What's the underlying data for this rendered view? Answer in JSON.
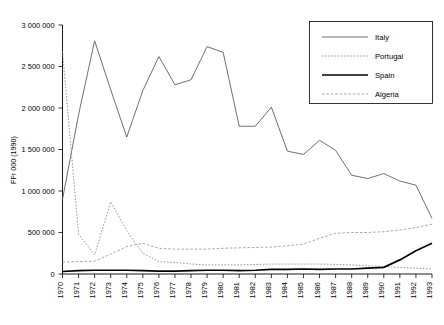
{
  "chart_data": {
    "type": "line",
    "title": "",
    "xlabel": "",
    "ylabel": "FFr 000 (1990)",
    "x": [
      1970,
      1971,
      1972,
      1973,
      1974,
      1975,
      1976,
      1977,
      1978,
      1979,
      1980,
      1981,
      1982,
      1983,
      1984,
      1985,
      1986,
      1987,
      1988,
      1989,
      1990,
      1991,
      1992,
      1993
    ],
    "xtick_labels": [
      "1970",
      "1971",
      "1972",
      "1973",
      "1974",
      "1975",
      "1976",
      "1977",
      "1978",
      "1979",
      "1980",
      "1981",
      "1982",
      "1983",
      "1984",
      "1985",
      "1986",
      "1987",
      "1988",
      "1989",
      "1990",
      "1991",
      "1992",
      "1993"
    ],
    "ytick_labels": [
      "0",
      "500 000",
      "1 000 000",
      "1 500 000",
      "2 000 000",
      "2 500 000",
      "3 000 000"
    ],
    "ytick_values": [
      0,
      500000,
      1000000,
      1500000,
      2000000,
      2500000,
      3000000
    ],
    "ylim": [
      0,
      3000000
    ],
    "xlim": [
      1970,
      1993
    ],
    "grid": false,
    "legend_position": "top-right",
    "series": [
      {
        "name": "Italy",
        "style": "thin-solid",
        "color": "#555555",
        "values": [
          900000,
          1920000,
          2810000,
          2220000,
          1650000,
          2210000,
          2620000,
          2280000,
          2340000,
          2740000,
          2670000,
          1780000,
          1780000,
          2010000,
          1480000,
          1440000,
          1610000,
          1490000,
          1190000,
          1150000,
          1210000,
          1120000,
          1070000,
          670000
        ]
      },
      {
        "name": "Portugal",
        "style": "dotted",
        "color": "#888888",
        "values": [
          2680000,
          480000,
          230000,
          870000,
          520000,
          250000,
          150000,
          140000,
          120000,
          110000,
          110000,
          110000,
          115000,
          120000,
          120000,
          120000,
          120000,
          115000,
          110000,
          100000,
          90000,
          80000,
          70000,
          60000
        ]
      },
      {
        "name": "Spain",
        "style": "thick-solid",
        "color": "#000000",
        "values": [
          30000,
          40000,
          45000,
          45000,
          45000,
          40000,
          35000,
          35000,
          40000,
          45000,
          45000,
          40000,
          45000,
          55000,
          55000,
          60000,
          55000,
          60000,
          60000,
          70000,
          80000,
          170000,
          280000,
          370000
        ]
      },
      {
        "name": "Algeria",
        "style": "dashed",
        "color": "#999999",
        "values": [
          145000,
          150000,
          155000,
          240000,
          330000,
          370000,
          310000,
          300000,
          300000,
          300000,
          310000,
          315000,
          320000,
          325000,
          340000,
          360000,
          430000,
          490000,
          500000,
          500000,
          510000,
          530000,
          560000,
          600000
        ]
      }
    ]
  },
  "legend": {
    "items": [
      {
        "label": "Italy"
      },
      {
        "label": "Portugal"
      },
      {
        "label": "Spain"
      },
      {
        "label": "Algeria"
      }
    ]
  }
}
